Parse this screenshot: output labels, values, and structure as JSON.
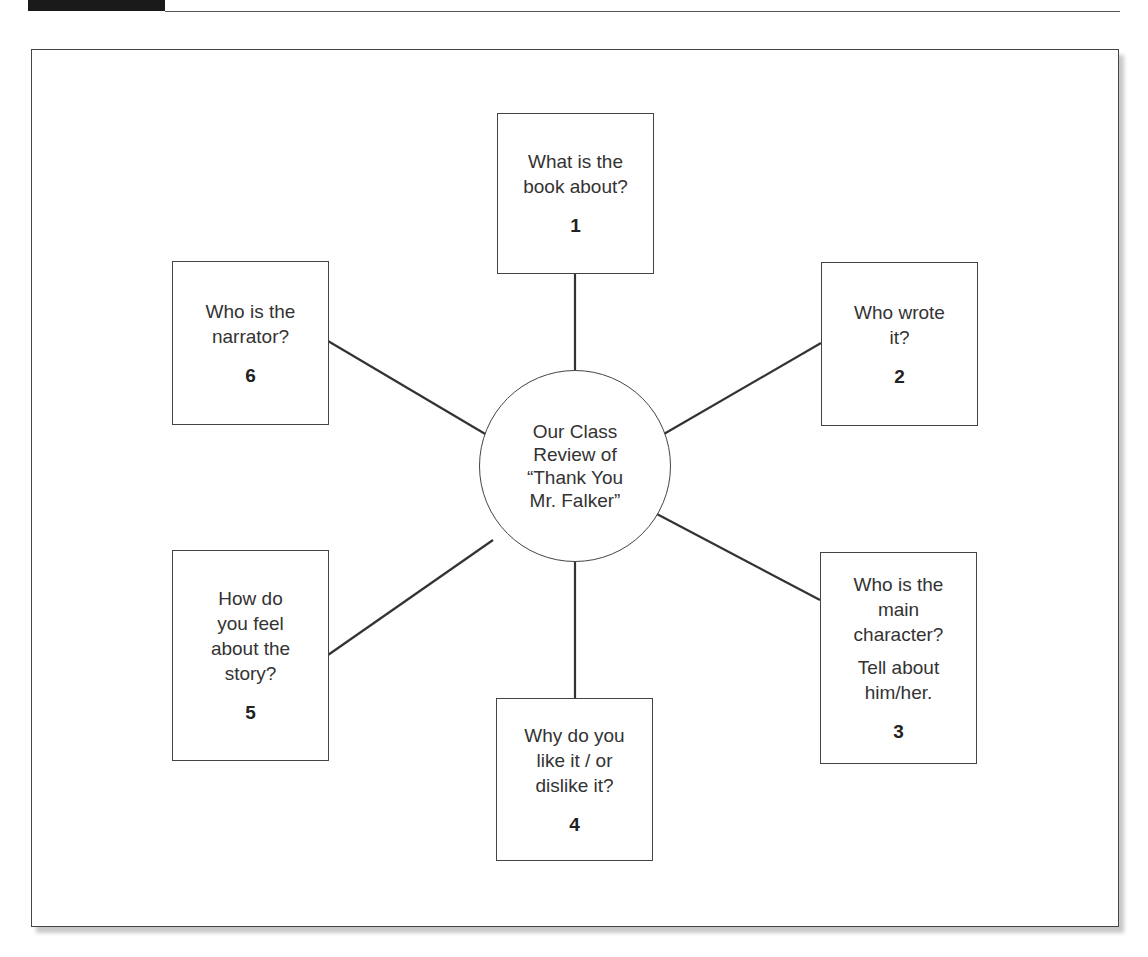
{
  "figure": {
    "center": {
      "label": "Our Class\nReview of\n“Thank You\nMr. Falker”"
    },
    "nodes": [
      {
        "number": "1",
        "question": "What is the\nbook about?"
      },
      {
        "number": "2",
        "question": "Who wrote\nit?"
      },
      {
        "number": "3",
        "question": "Who is the\nmain\ncharacter?",
        "question_extra": "Tell about\nhim/her."
      },
      {
        "number": "4",
        "question": "Why do you\nlike it / or\ndislike it?"
      },
      {
        "number": "5",
        "question": "How do\nyou feel\nabout the\nstory?"
      },
      {
        "number": "6",
        "question": "Who is the\nnarrator?"
      }
    ],
    "colors": {
      "stroke": "#444444",
      "header_block": "#1a1a1a",
      "background": "#ffffff"
    }
  }
}
